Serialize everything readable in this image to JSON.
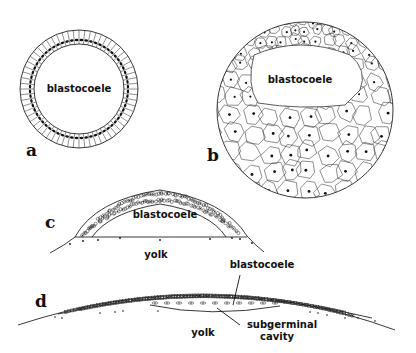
{
  "figure": {
    "panels": [
      {
        "letter": "a",
        "type": "coeloblastula",
        "labels": [
          "blastocoele"
        ]
      },
      {
        "letter": "b",
        "type": "amphiblastula",
        "labels": [
          "blastocoele"
        ]
      },
      {
        "letter": "c",
        "type": "discoblastula (early)",
        "labels": [
          "blastocoele",
          "yolk"
        ]
      },
      {
        "letter": "d",
        "type": "discoblastula (late)",
        "labels": [
          "blastocoele",
          "yolk",
          "subgerminal",
          "cavity"
        ]
      }
    ]
  },
  "colors": {
    "ink": "#111111",
    "background": "#ffffff"
  }
}
